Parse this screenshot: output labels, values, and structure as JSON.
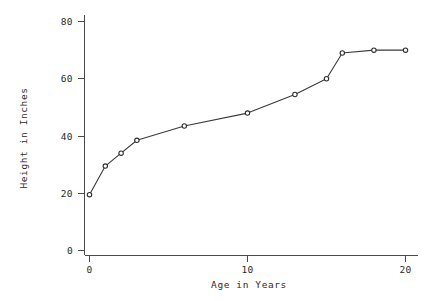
{
  "chart_data": {
    "type": "line",
    "title": "",
    "subtitle": "",
    "xlabel": "Age in Years",
    "ylabel": "Height in Inches",
    "xlim": [
      0,
      21
    ],
    "ylim": [
      0,
      84
    ],
    "xticks": [
      0,
      10,
      20
    ],
    "xtick_labels": [
      "0",
      "10",
      "20"
    ],
    "yticks": [
      0,
      20,
      40,
      60,
      80
    ],
    "ytick_labels": [
      "0",
      "20",
      "40",
      "60",
      "80"
    ],
    "grid": false,
    "legend": "none",
    "series": [
      {
        "name": "Height",
        "marker": "open-circle",
        "color": "#2f2f2f",
        "x": [
          0,
          1,
          2,
          3,
          6,
          10,
          13,
          15,
          16,
          18,
          20
        ],
        "values": [
          19.5,
          29.5,
          34,
          38.5,
          43.5,
          48,
          54.5,
          60,
          69,
          70,
          70
        ]
      }
    ],
    "points": [
      {
        "age": 0,
        "height": 19.5
      },
      {
        "age": 1,
        "height": 29.5
      },
      {
        "age": 2,
        "height": 34
      },
      {
        "age": 3,
        "height": 38.5
      },
      {
        "age": 6,
        "height": 43.5
      },
      {
        "age": 10,
        "height": 48
      },
      {
        "age": 13,
        "height": 54.5
      },
      {
        "age": 15,
        "height": 60
      },
      {
        "age": 16,
        "height": 69
      },
      {
        "age": 18,
        "height": 70
      },
      {
        "age": 20,
        "height": 70
      }
    ]
  },
  "axes": {
    "y_tick_0": "0",
    "y_tick_1": "20",
    "y_tick_2": "40",
    "y_tick_3": "60",
    "y_tick_4": "80",
    "x_tick_0": "0",
    "x_tick_1": "10",
    "x_tick_2": "20",
    "x_axis_title": "Age in Years",
    "y_axis_title": "Height in Inches"
  },
  "colors": {
    "background": "#ffffff",
    "axis": "#4a4a4a",
    "text": "#2b2b2b",
    "line": "#3a3a3a",
    "marker_fill": "#ffffff",
    "marker_stroke": "#2f2f2f"
  }
}
